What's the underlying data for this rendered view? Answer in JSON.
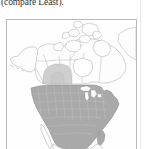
{
  "page": {
    "background_color": "#ffffff",
    "width": 144,
    "height": 149
  },
  "caption": {
    "text": "(compare Least).",
    "color": "#35312f",
    "note": "partially clipped line of body text above the figure"
  },
  "figure": {
    "name": "north-america-range-map",
    "border_color": "#b9b9b9",
    "background_color": "#fefefe",
    "legend_note": "no legend rendered",
    "regions": [
      {
        "name": "contiguous-united-states",
        "fill": "#a9a9a9",
        "stroke": "#8d8d8d",
        "shaded": true,
        "label": "Contiguous United States"
      },
      {
        "name": "western-canada-partial",
        "fill": "#cfcfcf",
        "stroke": "#b0b0b0",
        "shaded": true,
        "label": "Western Canada (partial)"
      },
      {
        "name": "canada",
        "fill": "#fdfdfd",
        "stroke": "#9a9a9a",
        "shaded": false,
        "label": "Canada"
      },
      {
        "name": "alaska",
        "fill": "#fdfdfd",
        "stroke": "#9a9a9a",
        "shaded": false,
        "label": "Alaska"
      },
      {
        "name": "arctic-archipelago",
        "fill": "#fdfdfd",
        "stroke": "#9a9a9a",
        "shaded": false,
        "label": "Canadian Arctic Archipelago"
      },
      {
        "name": "greenland-edge",
        "fill": "#fdfdfd",
        "stroke": "#9a9a9a",
        "shaded": false,
        "label": "Greenland (edge)"
      },
      {
        "name": "mexico",
        "fill": "#fdfdfd",
        "stroke": "#9a9a9a",
        "shaded": false,
        "label": "Mexico"
      }
    ]
  }
}
